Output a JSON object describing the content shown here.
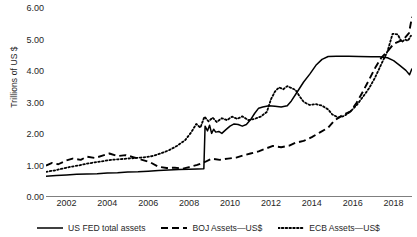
{
  "chart_data": {
    "type": "line",
    "title": "",
    "xlabel": "",
    "ylabel": "Trillions of US $",
    "xlim": [
      2001.0,
      2018.9
    ],
    "ylim": [
      0.0,
      6.0
    ],
    "yticks": [
      "0.00",
      "1.00",
      "2.00",
      "3.00",
      "4.00",
      "5.00",
      "6.00"
    ],
    "ytick_values": [
      0,
      1,
      2,
      3,
      4,
      5,
      6
    ],
    "xticks": [
      "2002",
      "2004",
      "2006",
      "2008",
      "2010",
      "2012",
      "2014",
      "2016",
      "2018"
    ],
    "xtick_values": [
      2002,
      2004,
      2006,
      2008,
      2010,
      2012,
      2014,
      2016,
      2018
    ],
    "grid": false,
    "legend_position": "bottom",
    "series": [
      {
        "name": "US FED total assets",
        "style": "solid",
        "color": "#000000",
        "points": [
          [
            2001.0,
            0.66
          ],
          [
            2001.5,
            0.68
          ],
          [
            2002.0,
            0.7
          ],
          [
            2002.5,
            0.72
          ],
          [
            2003.0,
            0.73
          ],
          [
            2003.5,
            0.74
          ],
          [
            2004.0,
            0.76
          ],
          [
            2004.5,
            0.77
          ],
          [
            2005.0,
            0.79
          ],
          [
            2005.5,
            0.8
          ],
          [
            2006.0,
            0.82
          ],
          [
            2006.5,
            0.84
          ],
          [
            2007.0,
            0.86
          ],
          [
            2007.5,
            0.87
          ],
          [
            2008.0,
            0.88
          ],
          [
            2008.4,
            0.89
          ],
          [
            2008.72,
            0.9
          ],
          [
            2008.78,
            2.25
          ],
          [
            2008.9,
            2.1
          ],
          [
            2009.0,
            2.28
          ],
          [
            2009.1,
            2.02
          ],
          [
            2009.2,
            2.15
          ],
          [
            2009.3,
            2.06
          ],
          [
            2009.45,
            2.08
          ],
          [
            2009.6,
            2.02
          ],
          [
            2009.8,
            2.14
          ],
          [
            2010.0,
            2.25
          ],
          [
            2010.2,
            2.32
          ],
          [
            2010.4,
            2.3
          ],
          [
            2010.6,
            2.25
          ],
          [
            2010.8,
            2.3
          ],
          [
            2011.0,
            2.45
          ],
          [
            2011.2,
            2.65
          ],
          [
            2011.4,
            2.82
          ],
          [
            2011.6,
            2.86
          ],
          [
            2011.9,
            2.9
          ],
          [
            2012.2,
            2.88
          ],
          [
            2012.5,
            2.86
          ],
          [
            2012.8,
            2.9
          ],
          [
            2013.0,
            3.05
          ],
          [
            2013.3,
            3.35
          ],
          [
            2013.6,
            3.65
          ],
          [
            2013.9,
            3.9
          ],
          [
            2014.2,
            4.18
          ],
          [
            2014.5,
            4.37
          ],
          [
            2014.8,
            4.46
          ],
          [
            2015.2,
            4.47
          ],
          [
            2015.8,
            4.47
          ],
          [
            2016.3,
            4.46
          ],
          [
            2016.9,
            4.45
          ],
          [
            2017.3,
            4.45
          ],
          [
            2017.7,
            4.42
          ],
          [
            2018.0,
            4.33
          ],
          [
            2018.3,
            4.18
          ],
          [
            2018.6,
            4.02
          ],
          [
            2018.78,
            3.88
          ],
          [
            2018.9,
            4.08
          ]
        ]
      },
      {
        "name": "BOJ Assets—US$",
        "style": "dashed",
        "color": "#000000",
        "points": [
          [
            2001.0,
            1.0
          ],
          [
            2001.3,
            1.08
          ],
          [
            2001.6,
            1.04
          ],
          [
            2002.0,
            1.16
          ],
          [
            2002.3,
            1.22
          ],
          [
            2002.7,
            1.18
          ],
          [
            2003.0,
            1.28
          ],
          [
            2003.4,
            1.24
          ],
          [
            2003.8,
            1.32
          ],
          [
            2004.1,
            1.38
          ],
          [
            2004.5,
            1.3
          ],
          [
            2004.9,
            1.33
          ],
          [
            2005.3,
            1.26
          ],
          [
            2005.7,
            1.18
          ],
          [
            2006.1,
            1.1
          ],
          [
            2006.5,
            0.96
          ],
          [
            2006.9,
            0.92
          ],
          [
            2007.3,
            0.93
          ],
          [
            2007.7,
            0.9
          ],
          [
            2008.0,
            0.95
          ],
          [
            2008.4,
            1.02
          ],
          [
            2008.8,
            1.12
          ],
          [
            2009.1,
            1.22
          ],
          [
            2009.5,
            1.18
          ],
          [
            2009.9,
            1.22
          ],
          [
            2010.3,
            1.25
          ],
          [
            2010.7,
            1.33
          ],
          [
            2011.0,
            1.38
          ],
          [
            2011.4,
            1.45
          ],
          [
            2011.8,
            1.55
          ],
          [
            2012.1,
            1.62
          ],
          [
            2012.5,
            1.58
          ],
          [
            2012.9,
            1.63
          ],
          [
            2013.2,
            1.72
          ],
          [
            2013.6,
            1.78
          ],
          [
            2014.0,
            1.9
          ],
          [
            2014.4,
            2.05
          ],
          [
            2014.8,
            2.2
          ],
          [
            2015.1,
            2.42
          ],
          [
            2015.5,
            2.6
          ],
          [
            2015.9,
            2.72
          ],
          [
            2016.2,
            3.0
          ],
          [
            2016.5,
            3.35
          ],
          [
            2016.8,
            3.72
          ],
          [
            2017.1,
            4.1
          ],
          [
            2017.4,
            4.42
          ],
          [
            2017.7,
            4.62
          ],
          [
            2018.0,
            4.86
          ],
          [
            2018.3,
            4.95
          ],
          [
            2018.55,
            5.05
          ],
          [
            2018.75,
            5.2
          ],
          [
            2018.9,
            5.72
          ]
        ]
      },
      {
        "name": "ECB Assets—US$",
        "style": "dotted",
        "color": "#000000",
        "points": [
          [
            2001.0,
            0.8
          ],
          [
            2001.4,
            0.84
          ],
          [
            2001.8,
            0.9
          ],
          [
            2002.2,
            0.96
          ],
          [
            2002.6,
            1.0
          ],
          [
            2003.0,
            1.06
          ],
          [
            2003.4,
            1.1
          ],
          [
            2003.8,
            1.14
          ],
          [
            2004.2,
            1.18
          ],
          [
            2004.6,
            1.2
          ],
          [
            2005.0,
            1.22
          ],
          [
            2005.4,
            1.24
          ],
          [
            2005.8,
            1.26
          ],
          [
            2006.2,
            1.3
          ],
          [
            2006.6,
            1.38
          ],
          [
            2007.0,
            1.48
          ],
          [
            2007.4,
            1.62
          ],
          [
            2007.8,
            1.8
          ],
          [
            2008.1,
            2.05
          ],
          [
            2008.35,
            2.32
          ],
          [
            2008.55,
            2.2
          ],
          [
            2008.75,
            2.55
          ],
          [
            2008.95,
            2.4
          ],
          [
            2009.15,
            2.52
          ],
          [
            2009.35,
            2.38
          ],
          [
            2009.6,
            2.5
          ],
          [
            2009.85,
            2.44
          ],
          [
            2010.1,
            2.55
          ],
          [
            2010.35,
            2.48
          ],
          [
            2010.6,
            2.56
          ],
          [
            2010.9,
            2.44
          ],
          [
            2011.2,
            2.48
          ],
          [
            2011.5,
            2.55
          ],
          [
            2011.8,
            2.7
          ],
          [
            2012.0,
            3.1
          ],
          [
            2012.2,
            3.35
          ],
          [
            2012.4,
            3.48
          ],
          [
            2012.6,
            3.42
          ],
          [
            2012.8,
            3.52
          ],
          [
            2013.0,
            3.46
          ],
          [
            2013.2,
            3.4
          ],
          [
            2013.4,
            3.2
          ],
          [
            2013.6,
            3.02
          ],
          [
            2013.9,
            2.92
          ],
          [
            2014.2,
            2.95
          ],
          [
            2014.5,
            2.9
          ],
          [
            2014.8,
            2.78
          ],
          [
            2015.0,
            2.62
          ],
          [
            2015.3,
            2.52
          ],
          [
            2015.6,
            2.58
          ],
          [
            2015.9,
            2.72
          ],
          [
            2016.2,
            2.92
          ],
          [
            2016.5,
            3.18
          ],
          [
            2016.8,
            3.45
          ],
          [
            2017.1,
            3.8
          ],
          [
            2017.4,
            4.22
          ],
          [
            2017.7,
            4.62
          ],
          [
            2017.95,
            5.18
          ],
          [
            2018.2,
            5.16
          ],
          [
            2018.4,
            4.92
          ],
          [
            2018.55,
            5.0
          ],
          [
            2018.7,
            4.96
          ],
          [
            2018.85,
            5.12
          ]
        ]
      }
    ]
  },
  "legend": {
    "items": [
      {
        "label": "US FED total assets",
        "style": "solid"
      },
      {
        "label": "BOJ Assets—US$",
        "style": "dashed"
      },
      {
        "label": "ECB Assets—US$",
        "style": "dotted"
      }
    ]
  }
}
